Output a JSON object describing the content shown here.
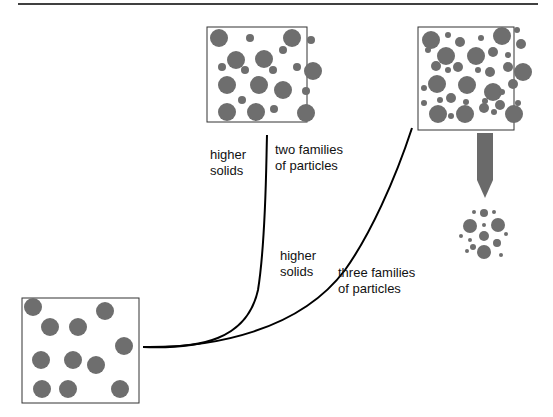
{
  "diagram": {
    "colors": {
      "particle": "#6e6e6e",
      "box_border": "#333333",
      "curve": "#000000",
      "top_rule": "#000000",
      "arrow": "#6a6a6a"
    },
    "panels": [
      {
        "id": "single-family",
        "description": "one family of large particles, loose packing"
      },
      {
        "id": "two-families",
        "description": "large and medium particles"
      },
      {
        "id": "three-families",
        "description": "large, medium and small particles"
      }
    ],
    "labels": {
      "branch1_left": "higher\nsolids",
      "branch1_right": "two families\nof particles",
      "branch2_left": "higher\nsolids",
      "branch2_right": "three families\nof particles"
    },
    "cluster": {
      "description": "packed cluster of three particle sizes"
    }
  }
}
